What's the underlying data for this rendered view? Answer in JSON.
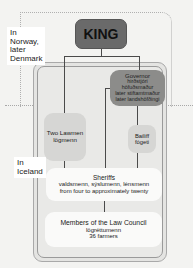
{
  "regions": {
    "norway": "In Norway, later Denmark",
    "norway_lines": [
      "In",
      "Norway,",
      "later",
      "Denmark"
    ],
    "iceland_lines": [
      "In",
      "Iceland"
    ]
  },
  "nodes": {
    "king": {
      "title": "KING"
    },
    "governor": {
      "title": "Governor",
      "lines": [
        "hirðstjóri",
        "höfuðsmaður",
        "later stiftamtmaður",
        "later landshöfðingi"
      ]
    },
    "lawmen": {
      "title": "Two Lawmen",
      "lines": [
        "lögmenn"
      ]
    },
    "bailiff": {
      "title": "Bailiff",
      "lines": [
        "fógeti"
      ]
    },
    "sheriffs": {
      "title": "Sheriffs",
      "lines": [
        "valdsmenn, sýslumenn, lénsmenn",
        "from four to approximately twenty"
      ]
    },
    "council": {
      "title": "Members of the Law Council",
      "lines": [
        "lögréttumenn",
        "36 farmers"
      ]
    }
  },
  "colors": {
    "king": "#6a6a6a",
    "governor": "#8c8c8a",
    "mid_nodes": "#d6d6d4",
    "light_nodes": "#fafaf9",
    "background": "#f3f3f1"
  }
}
